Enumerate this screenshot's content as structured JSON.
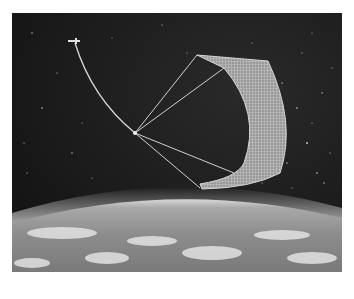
{
  "image": {
    "subject": "Space tether with net sail above Earth",
    "elements": [
      "starfield",
      "satellite",
      "tether",
      "net-sail",
      "earth-horizon",
      "clouds"
    ],
    "colors": {
      "space": "#1c1c1c",
      "tether": "#d8d8d8",
      "sail": "#bdbdbd",
      "atmosphere": "#e6e6e6",
      "earth": "#8a8a8a"
    }
  }
}
